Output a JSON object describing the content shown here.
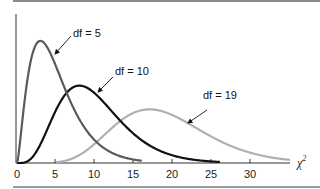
{
  "chart_data": {
    "type": "line",
    "title": "",
    "xlabel": "χ²",
    "ylabel": "",
    "xlim": [
      0,
      35
    ],
    "ylim": [
      0,
      0.16
    ],
    "grid": false,
    "legend_position": "inline annotations with arrows",
    "x_ticks": [
      0,
      5,
      10,
      15,
      20,
      25,
      30
    ],
    "x_tick_labels": [
      "0",
      "5",
      "10",
      "15",
      "20",
      "25",
      "30"
    ],
    "series": [
      {
        "name": "df = 5",
        "df": 5,
        "color": "#5a5a5a",
        "x_range": [
          0,
          16
        ],
        "peak": {
          "x": 3,
          "y": 0.154
        },
        "x": [
          0,
          1,
          2,
          3,
          4,
          5,
          6,
          8,
          10,
          12,
          14,
          16
        ],
        "values": [
          0,
          0.08,
          0.138,
          0.154,
          0.144,
          0.122,
          0.097,
          0.055,
          0.028,
          0.013,
          0.006,
          0.003
        ]
      },
      {
        "name": "df = 10",
        "df": 10,
        "color": "#111111",
        "x_range": [
          0,
          26
        ],
        "peak": {
          "x": 8,
          "y": 0.098
        },
        "x": [
          0,
          2,
          4,
          6,
          8,
          10,
          12,
          14,
          16,
          18,
          20,
          22,
          24,
          26
        ],
        "values": [
          0,
          0.008,
          0.045,
          0.084,
          0.098,
          0.088,
          0.067,
          0.045,
          0.028,
          0.016,
          0.009,
          0.005,
          0.003,
          0.001
        ]
      },
      {
        "name": "df = 19",
        "df": 19,
        "color": "#b0b0b0",
        "x_range": [
          5,
          35
        ],
        "peak": {
          "x": 17,
          "y": 0.068
        },
        "x": [
          5,
          8,
          11,
          14,
          17,
          20,
          23,
          26,
          29,
          32,
          35
        ],
        "values": [
          0.001,
          0.007,
          0.027,
          0.054,
          0.068,
          0.062,
          0.045,
          0.027,
          0.014,
          0.007,
          0.003
        ]
      }
    ],
    "annotations": [
      {
        "text": "df = 5",
        "points_to": "df = 5 curve"
      },
      {
        "text": "df = 10",
        "points_to": "df = 10 curve"
      },
      {
        "text": "df = 19",
        "points_to": "df = 19 curve"
      }
    ]
  },
  "labels": {
    "df5": "df = 5",
    "df10": "df = 10",
    "df19": "df = 19",
    "x_axis": "χ",
    "x_axis_sup": "2",
    "ticks": [
      "0",
      "5",
      "10",
      "15",
      "20",
      "25",
      "30"
    ]
  }
}
